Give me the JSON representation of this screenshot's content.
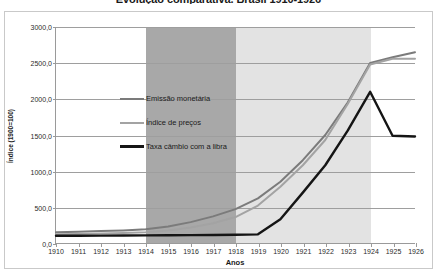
{
  "chart_data": {
    "type": "line",
    "title": "Evolução comparativa. Brasil 1910-1926",
    "xlabel": "Anos",
    "ylabel": "Índice (1900=100)",
    "x": [
      1910,
      1911,
      1912,
      1913,
      1914,
      1915,
      1916,
      1917,
      1918,
      1919,
      1920,
      1921,
      1922,
      1923,
      1924,
      1925,
      1926
    ],
    "xtick_labels": [
      "1910",
      "1911",
      "1912",
      "1913",
      "1914",
      "1915",
      "1916",
      "1917",
      "1918",
      "1919",
      "1920",
      "1921",
      "1922",
      "1923",
      "1924",
      "1925",
      "1926"
    ],
    "ytick_labels": [
      "0,0",
      "500,0",
      "1000,0",
      "1500,0",
      "2000,0",
      "2500,0",
      "3000,0"
    ],
    "ytick_values": [
      0,
      500,
      1000,
      1500,
      2000,
      2500,
      3000
    ],
    "ylim": [
      0,
      3000
    ],
    "xlim": [
      1910,
      1926
    ],
    "grid": true,
    "legend_position": "inside-upper-left",
    "series": [
      {
        "name": "Emissão monetária",
        "color": "#7b7b7b",
        "width": 2,
        "values": [
          150,
          155,
          165,
          175,
          190,
          230,
          290,
          370,
          470,
          620,
          850,
          1150,
          1500,
          1950,
          2500,
          2580,
          2650
        ]
      },
      {
        "name": "Índice de preços",
        "color": "#a3a3a3",
        "width": 2,
        "values": [
          120,
          125,
          132,
          140,
          150,
          175,
          215,
          275,
          360,
          520,
          780,
          1080,
          1430,
          1930,
          2480,
          2560,
          2560
        ]
      },
      {
        "name": "Taxa câmbio com a libra",
        "color": "#151515",
        "width": 2.4,
        "values": [
          100,
          100,
          102,
          104,
          106,
          108,
          110,
          112,
          115,
          120,
          330,
          700,
          1080,
          1560,
          2100,
          1490,
          1480
        ]
      }
    ],
    "bands": [
      {
        "name": "periodo-guerra",
        "from": 1914,
        "to": 1918,
        "color": "#a8a8a8"
      },
      {
        "name": "periodo-pos-guerra",
        "from": 1918,
        "to": 1924,
        "color": "#e3e3e3"
      }
    ]
  }
}
